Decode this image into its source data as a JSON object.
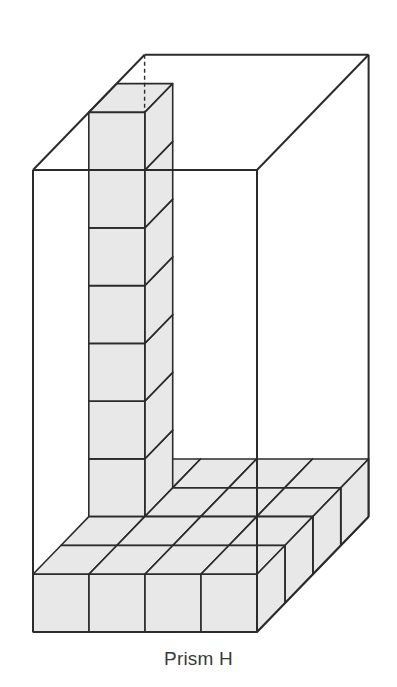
{
  "caption": "Prism H",
  "colors": {
    "line": "#2b2b2b",
    "cube_fill": "#e8e8e8",
    "background": "#ffffff"
  },
  "diagram": {
    "type": "rectangular prism partially filled with unit cubes",
    "prism": {
      "width_cubes": 4,
      "depth_cubes": 4,
      "height_cubes": 8
    },
    "filled": {
      "bottom_layer": {
        "width": 4,
        "depth": 4,
        "cubes": 16
      },
      "column": {
        "position": "left side, depth row 2",
        "cubes_above_bottom_layer": 7
      }
    },
    "hidden_edge": "dashed vertical back-left edge"
  }
}
